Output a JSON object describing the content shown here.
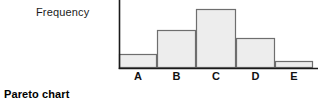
{
  "caption": "Pareto chart",
  "chart_data": {
    "type": "bar",
    "title": "",
    "subtitle": "",
    "xlabel": "",
    "ylabel": "Frequency",
    "categories": [
      "A",
      "B",
      "C",
      "D",
      "E"
    ],
    "values": [
      14,
      38,
      59,
      30,
      7
    ],
    "ylim": [
      0,
      68
    ],
    "grid": false,
    "legend": null,
    "annotations": [],
    "axis_note": "y-axis unlabeled (no tick values); bars sorted descending after the leading category",
    "colors": {
      "bar_fill": "#ededed",
      "bar_stroke": "#6e6e6e",
      "axis": "#1a1a1a",
      "text": "#111111",
      "background": "#ffffff"
    },
    "geometry": {
      "baseline_y": 68,
      "axis_x": 119,
      "axis_right_x": 318,
      "bar_edges": [
        119,
        157,
        196,
        236,
        275,
        313
      ],
      "bar_tops": [
        54,
        30,
        9,
        38,
        61
      ],
      "label_centers": [
        138,
        176,
        216,
        255,
        294
      ]
    }
  }
}
